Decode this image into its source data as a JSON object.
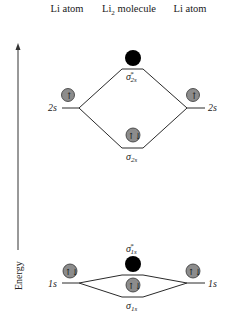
{
  "headers": {
    "left": "Li atom",
    "center_main": "Li",
    "center_sub": "2",
    "center_rest": " molecule",
    "right": "Li atom"
  },
  "axis": {
    "label": "Energy",
    "direction": "up"
  },
  "levels": {
    "left_2s": {
      "label": "2s",
      "electrons": "↑",
      "occupancy": 1
    },
    "right_2s": {
      "label": "2s",
      "electrons": "↑",
      "occupancy": 1
    },
    "sigma_star_2s": {
      "symbol": "σ",
      "sup": "*",
      "sub": "2s",
      "occupancy": 0,
      "state": "empty (antibonding)"
    },
    "sigma_2s": {
      "symbol": "σ",
      "sub": "2s",
      "electrons": "↑↓",
      "occupancy": 2
    },
    "left_1s": {
      "label": "1s",
      "electrons": "↑↓",
      "occupancy": 2
    },
    "right_1s": {
      "label": "1s",
      "electrons": "↑↓",
      "occupancy": 2
    },
    "sigma_star_1s": {
      "symbol": "σ",
      "sup": "*",
      "sub": "1s",
      "occupancy": 0,
      "state": "filled circle shown"
    },
    "sigma_1s": {
      "symbol": "σ",
      "sub": "1s",
      "electrons": "↑↓",
      "occupancy": 2
    }
  },
  "colors": {
    "orbital_fill": "#8c8c8c",
    "antibonding_fill": "#000000",
    "line": "#2a2a2a"
  }
}
